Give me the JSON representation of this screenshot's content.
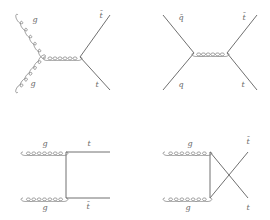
{
  "figure": {
    "colors": {
      "line": "#707070",
      "label": "#6a6a6a",
      "background": "#ffffff"
    }
  },
  "diagrams": [
    {
      "id": "gg-s-channel",
      "process": "g g → t t̄ (s-channel)",
      "labels": {
        "in_top": "g",
        "in_bottom": "g",
        "out_top": "t̄",
        "out_bottom": "t"
      }
    },
    {
      "id": "qqbar-s-channel",
      "process": "q q̄ → t t̄ (s-channel)",
      "labels": {
        "in_top": "q̄",
        "in_bottom": "q",
        "out_top": "t̄",
        "out_bottom": "t"
      }
    },
    {
      "id": "gg-t-channel",
      "process": "g g → t t̄ (t-channel)",
      "labels": {
        "in_top": "g",
        "in_bottom": "g",
        "out_top": "t",
        "out_bottom": "t̄"
      }
    },
    {
      "id": "gg-u-channel",
      "process": "g g → t t̄ (u-channel)",
      "labels": {
        "in_top": "g",
        "in_bottom": "g",
        "out_top": "t̄",
        "out_bottom": "t"
      }
    }
  ]
}
